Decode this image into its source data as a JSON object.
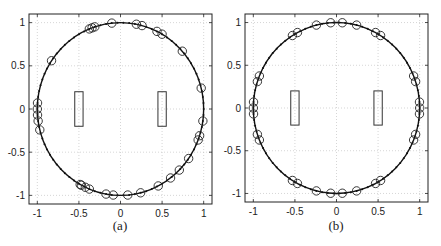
{
  "figure": {
    "panels": [
      {
        "id": "a",
        "caption": "(a)",
        "box": {
          "left": 29,
          "top": 14,
          "right": 212,
          "bottom": 204
        },
        "caption_pos": {
          "x": 100,
          "y": 218
        }
      },
      {
        "id": "b",
        "caption": "(b)",
        "box": {
          "left": 245,
          "top": 14,
          "right": 428,
          "bottom": 202
        },
        "caption_pos": {
          "x": 316,
          "y": 218
        }
      }
    ]
  },
  "chart_data": [
    {
      "type": "scatter",
      "title": "",
      "panel_label": "(a)",
      "xlabel": "",
      "ylabel": "",
      "xlim": [
        -1.1,
        1.1
      ],
      "ylim": [
        -1.1,
        1.1
      ],
      "xticks": [
        -1,
        -0.5,
        0,
        0.5,
        1
      ],
      "yticks": [
        -1,
        -0.5,
        0,
        0.5,
        1
      ],
      "xtick_labels": [
        "-1",
        "-0.5",
        "0",
        "0.5",
        "1"
      ],
      "ytick_labels": [
        "-1",
        "-0.5",
        "0",
        "0.5",
        "1"
      ],
      "grid": true,
      "circle": {
        "center": [
          0,
          0
        ],
        "radius": 1,
        "style": "solid line with dots"
      },
      "rectangles": [
        {
          "x": [
            -0.55,
            -0.45
          ],
          "y": [
            -0.2,
            0.2
          ]
        },
        {
          "x": [
            0.45,
            0.55
          ],
          "y": [
            -0.2,
            0.2
          ]
        }
      ],
      "series": [
        {
          "name": "circled points",
          "marker": "circle",
          "angles_deg": [
            96,
            112,
            110,
            108,
            79,
            75,
            64,
            60,
            42,
            146,
            176,
            180,
            184,
            188,
            194,
            14,
            352,
            342,
            339,
            325,
            315,
            307,
            297,
            284,
            275,
            265,
            260,
            248,
            245,
            242,
            241
          ]
        }
      ]
    },
    {
      "type": "scatter",
      "title": "",
      "panel_label": "(b)",
      "xlabel": "",
      "ylabel": "",
      "xlim": [
        -1.1,
        1.1
      ],
      "ylim": [
        -1.1,
        1.1
      ],
      "xticks": [
        -1,
        -0.5,
        0,
        0.5,
        1
      ],
      "yticks": [
        -1,
        -0.5,
        0,
        0.5,
        1
      ],
      "xtick_labels": [
        "-1",
        "-0.5",
        "0",
        "0.5",
        "1"
      ],
      "ytick_labels": [
        "-1",
        "-0.5",
        "0",
        "0.5",
        "1"
      ],
      "grid": true,
      "circle": {
        "center": [
          0,
          0
        ],
        "radius": 1,
        "style": "solid line with dots"
      },
      "rectangles": [
        {
          "x": [
            -0.55,
            -0.45
          ],
          "y": [
            -0.2,
            0.2
          ]
        },
        {
          "x": [
            0.45,
            0.55
          ],
          "y": [
            -0.2,
            0.2
          ]
        }
      ],
      "series": [
        {
          "name": "circled points",
          "marker": "circle",
          "angles_deg": [
            76,
            86,
            94,
            104,
            118,
            122,
            58,
            62,
            158,
            162,
            176,
            180,
            184,
            198,
            202,
            22,
            18,
            4,
            0,
            356,
            342,
            338,
            238,
            242,
            256,
            266,
            274,
            284,
            298,
            302
          ]
        }
      ]
    }
  ]
}
